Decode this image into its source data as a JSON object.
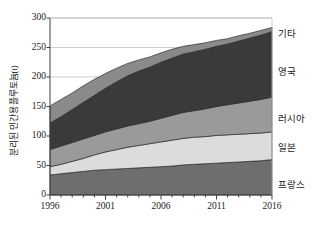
{
  "chart_data": {
    "type": "area",
    "stacked": true,
    "title": "",
    "xlabel": "",
    "ylabel": "분리된 민간용 플루토늄(t)",
    "xlim": [
      1996,
      2016
    ],
    "ylim": [
      0,
      300
    ],
    "grid": true,
    "grid_axis": "y",
    "legend_position": "right-inline",
    "x": [
      1996,
      1997,
      1998,
      1999,
      2000,
      2001,
      2002,
      2003,
      2004,
      2005,
      2006,
      2007,
      2008,
      2009,
      2010,
      2011,
      2012,
      2013,
      2014,
      2015,
      2016
    ],
    "xticks": [
      1996,
      2001,
      2006,
      2011,
      2016
    ],
    "xticklabels": [
      "1996",
      "2001",
      "2006",
      "2011",
      "2016"
    ],
    "yticks": [
      0,
      50,
      100,
      150,
      200,
      250,
      300
    ],
    "yticklabels": [
      "0",
      "50",
      "100",
      "150",
      "200",
      "250",
      "300"
    ],
    "series": [
      {
        "name": "프랑스",
        "color": "#6e6e6e",
        "values": [
          34,
          36,
          38,
          40,
          42,
          43,
          44,
          45,
          46,
          47,
          48,
          49,
          51,
          52,
          53,
          54,
          55,
          56,
          57,
          58,
          60
        ]
      },
      {
        "name": "일본",
        "color": "#dcdcdc",
        "values": [
          14,
          16,
          19,
          22,
          26,
          30,
          33,
          36,
          38,
          40,
          42,
          44,
          45,
          46,
          46,
          47,
          47,
          47,
          47,
          47,
          47
        ]
      },
      {
        "name": "러시아",
        "color": "#9a9a9a",
        "values": [
          29,
          31,
          32,
          33,
          33,
          34,
          35,
          36,
          37,
          38,
          40,
          42,
          44,
          45,
          47,
          49,
          51,
          53,
          55,
          57,
          59
        ]
      },
      {
        "name": "영국",
        "color": "#3a3a3a",
        "values": [
          45,
          50,
          56,
          62,
          68,
          74,
          80,
          85,
          89,
          92,
          95,
          97,
          99,
          100,
          101,
          102,
          103,
          105,
          107,
          109,
          111
        ]
      },
      {
        "name": "기타",
        "color": "#8a8a8a",
        "values": [
          29,
          29,
          28,
          28,
          27,
          25,
          23,
          21,
          19,
          17,
          16,
          15,
          13,
          12,
          11,
          10,
          9,
          9,
          8,
          8,
          7
        ]
      }
    ],
    "series_label_y": {
      "기타": 30,
      "영국": 68,
      "러시아": 115,
      "일본": 144,
      "프랑스": 181
    }
  },
  "axes": {
    "plot_left": 50,
    "plot_right": 272,
    "plot_top": 18,
    "plot_bottom": 195
  },
  "colors": {
    "axis": "#404040",
    "grid": "#bfbfbf",
    "text": "#1a1a1a",
    "background": "#ffffff"
  }
}
